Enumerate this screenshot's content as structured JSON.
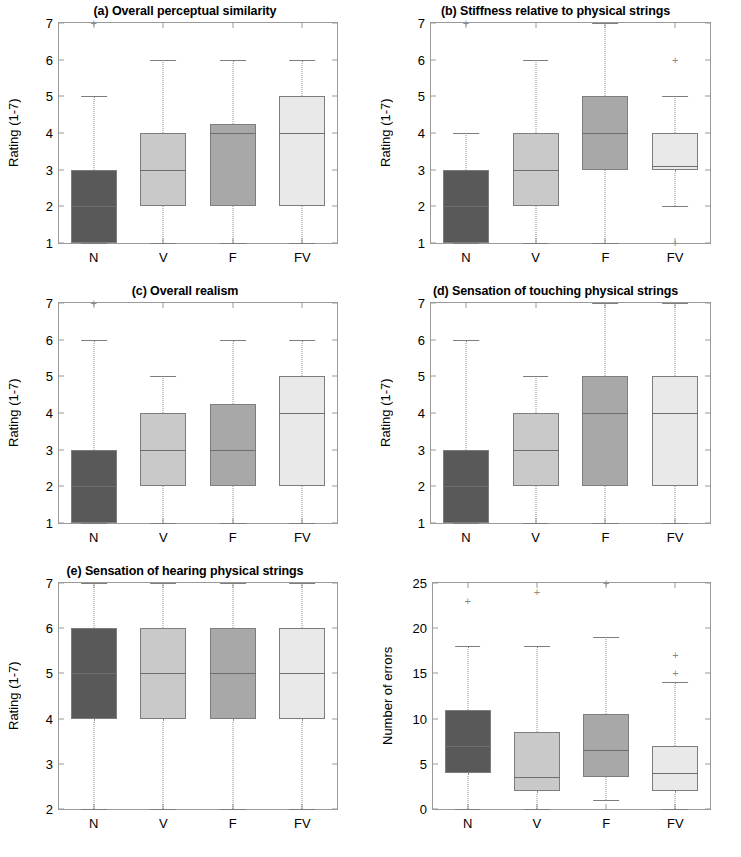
{
  "figure": {
    "categories": [
      "N",
      "V",
      "F",
      "FV"
    ],
    "category_colors": {
      "N": "#595959",
      "V": "#c9c9c9",
      "F": "#a8a8a8",
      "FV": "#e9e9e9"
    },
    "box_edge_color": "#7d7d7d",
    "whisker_color": "#8a8a8a",
    "outlier_marker": "+",
    "background": "#ffffff"
  },
  "chart_data": [
    {
      "type": "box",
      "panel": "a",
      "title": "(a) Overall perceptual similarity",
      "xlabel": "",
      "ylabel": "Rating (1-7)",
      "ylim": [
        1,
        7
      ],
      "yticks": [
        1,
        2,
        3,
        4,
        5,
        6,
        7
      ],
      "categories": [
        "N",
        "V",
        "F",
        "FV"
      ],
      "boxes": [
        {
          "name": "N",
          "q1": 1,
          "median": 2,
          "q3": 3,
          "whisker_low": 1,
          "whisker_high": 5,
          "outliers": [
            7
          ]
        },
        {
          "name": "V",
          "q1": 2,
          "median": 3,
          "q3": 4,
          "whisker_low": 1,
          "whisker_high": 6,
          "outliers": []
        },
        {
          "name": "F",
          "q1": 2,
          "median": 4,
          "q3": 4.25,
          "whisker_low": 1,
          "whisker_high": 6,
          "outliers": []
        },
        {
          "name": "FV",
          "q1": 2,
          "median": 4,
          "q3": 5,
          "whisker_low": 1,
          "whisker_high": 6,
          "outliers": []
        }
      ]
    },
    {
      "type": "box",
      "panel": "b",
      "title": "(b) Stiffness relative to physical strings",
      "xlabel": "",
      "ylabel": "Rating (1-7)",
      "ylim": [
        1,
        7
      ],
      "yticks": [
        1,
        2,
        3,
        4,
        5,
        6,
        7
      ],
      "categories": [
        "N",
        "V",
        "F",
        "FV"
      ],
      "boxes": [
        {
          "name": "N",
          "q1": 1,
          "median": 2,
          "q3": 3,
          "whisker_low": 1,
          "whisker_high": 4,
          "outliers": [
            7
          ]
        },
        {
          "name": "V",
          "q1": 2,
          "median": 3,
          "q3": 4,
          "whisker_low": 1,
          "whisker_high": 6,
          "outliers": []
        },
        {
          "name": "F",
          "q1": 3,
          "median": 4,
          "q3": 5,
          "whisker_low": 1,
          "whisker_high": 7,
          "outliers": []
        },
        {
          "name": "FV",
          "q1": 3,
          "median": 3.1,
          "q3": 4,
          "whisker_low": 2,
          "whisker_high": 5,
          "outliers": [
            6,
            1
          ]
        }
      ]
    },
    {
      "type": "box",
      "panel": "c",
      "title": "(c) Overall realism",
      "xlabel": "",
      "ylabel": "Rating (1-7)",
      "ylim": [
        1,
        7
      ],
      "yticks": [
        1,
        2,
        3,
        4,
        5,
        6,
        7
      ],
      "categories": [
        "N",
        "V",
        "F",
        "FV"
      ],
      "boxes": [
        {
          "name": "N",
          "q1": 1,
          "median": 2,
          "q3": 3,
          "whisker_low": 1,
          "whisker_high": 6,
          "outliers": [
            7
          ]
        },
        {
          "name": "V",
          "q1": 2,
          "median": 3,
          "q3": 4,
          "whisker_low": 1,
          "whisker_high": 5,
          "outliers": []
        },
        {
          "name": "F",
          "q1": 2,
          "median": 3,
          "q3": 4.25,
          "whisker_low": 1,
          "whisker_high": 6,
          "outliers": []
        },
        {
          "name": "FV",
          "q1": 2,
          "median": 4,
          "q3": 5,
          "whisker_low": 1,
          "whisker_high": 6,
          "outliers": []
        }
      ]
    },
    {
      "type": "box",
      "panel": "d",
      "title": "(d) Sensation of touching physical strings",
      "xlabel": "",
      "ylabel": "Rating (1-7)",
      "ylim": [
        1,
        7
      ],
      "yticks": [
        1,
        2,
        3,
        4,
        5,
        6,
        7
      ],
      "categories": [
        "N",
        "V",
        "F",
        "FV"
      ],
      "boxes": [
        {
          "name": "N",
          "q1": 1,
          "median": 2,
          "q3": 3,
          "whisker_low": 1,
          "whisker_high": 6,
          "outliers": []
        },
        {
          "name": "V",
          "q1": 2,
          "median": 3,
          "q3": 4,
          "whisker_low": 1,
          "whisker_high": 5,
          "outliers": []
        },
        {
          "name": "F",
          "q1": 2,
          "median": 4,
          "q3": 5,
          "whisker_low": 1,
          "whisker_high": 7,
          "outliers": []
        },
        {
          "name": "FV",
          "q1": 2,
          "median": 4,
          "q3": 5,
          "whisker_low": 1,
          "whisker_high": 7,
          "outliers": []
        }
      ]
    },
    {
      "type": "box",
      "panel": "e",
      "title": "(e) Sensation of hearing physical strings",
      "xlabel": "",
      "ylabel": "Rating (1-7)",
      "ylim": [
        2,
        7
      ],
      "yticks": [
        2,
        3,
        4,
        5,
        6,
        7
      ],
      "categories": [
        "N",
        "V",
        "F",
        "FV"
      ],
      "boxes": [
        {
          "name": "N",
          "q1": 4,
          "median": 5,
          "q3": 6,
          "whisker_low": 2,
          "whisker_high": 7,
          "outliers": []
        },
        {
          "name": "V",
          "q1": 4,
          "median": 5,
          "q3": 6,
          "whisker_low": 2,
          "whisker_high": 7,
          "outliers": []
        },
        {
          "name": "F",
          "q1": 4,
          "median": 5,
          "q3": 6,
          "whisker_low": 2,
          "whisker_high": 7,
          "outliers": []
        },
        {
          "name": "FV",
          "q1": 4,
          "median": 5,
          "q3": 6,
          "whisker_low": 2,
          "whisker_high": 7,
          "outliers": []
        }
      ]
    },
    {
      "type": "box",
      "panel": "f",
      "title": "",
      "xlabel": "",
      "ylabel": "Number of errors",
      "ylim": [
        0,
        25
      ],
      "yticks": [
        0,
        5,
        10,
        15,
        20,
        25
      ],
      "categories": [
        "N",
        "V",
        "F",
        "FV"
      ],
      "boxes": [
        {
          "name": "N",
          "q1": 4,
          "median": 7,
          "q3": 11,
          "whisker_low": 0,
          "whisker_high": 18,
          "outliers": [
            23
          ]
        },
        {
          "name": "V",
          "q1": 2,
          "median": 3.5,
          "q3": 8.5,
          "whisker_low": 0,
          "whisker_high": 18,
          "outliers": [
            24
          ]
        },
        {
          "name": "F",
          "q1": 3.5,
          "median": 6.5,
          "q3": 10.5,
          "whisker_low": 1,
          "whisker_high": 19,
          "outliers": [
            25
          ]
        },
        {
          "name": "FV",
          "q1": 2,
          "median": 4,
          "q3": 7,
          "whisker_low": 0,
          "whisker_high": 14,
          "outliers": [
            15,
            17
          ]
        }
      ]
    }
  ]
}
